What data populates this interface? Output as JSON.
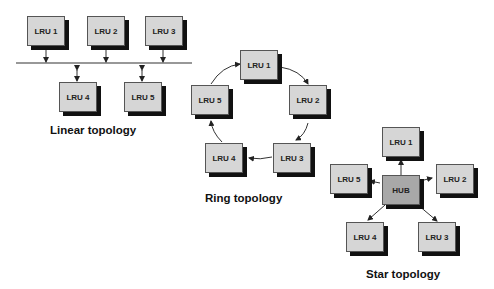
{
  "diagram": {
    "linear": {
      "caption": "Linear topology",
      "nodes": [
        "LRU 1",
        "LRU 2",
        "LRU 3",
        "LRU 4",
        "LRU 5"
      ]
    },
    "ring": {
      "caption": "Ring topology",
      "nodes": [
        "LRU 1",
        "LRU 2",
        "LRU 3",
        "LRU 4",
        "LRU 5"
      ]
    },
    "star": {
      "caption": "Star topology",
      "hub": "HUB",
      "nodes": [
        "LRU 1",
        "LRU 2",
        "LRU 3",
        "LRU 4",
        "LRU 5"
      ]
    },
    "colors": {
      "node_fill": "#d6d6d6",
      "hub_fill": "#a8a8a8",
      "shadow": "#111111"
    }
  }
}
